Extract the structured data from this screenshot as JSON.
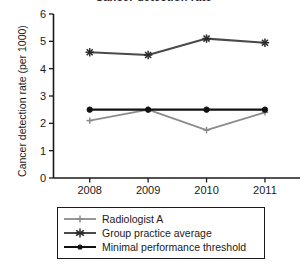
{
  "chart_data": {
    "type": "line",
    "title": "Cancer detection rate",
    "xlabel": "",
    "ylabel": "Cancer detection rate (per 1000)",
    "categories": [
      "2008",
      "2009",
      "2010",
      "2011"
    ],
    "x_tick_labels": [
      "2008",
      "2009",
      "2010",
      "2011"
    ],
    "y_tick_labels": [
      "0",
      "1",
      "2",
      "3",
      "4",
      "5",
      "6"
    ],
    "ylim": [
      0,
      6
    ],
    "y_tick_step": 1,
    "grid": false,
    "legend_position": "below-axes",
    "series": [
      {
        "name": "Radiologist A",
        "values": [
          2.1,
          2.5,
          1.75,
          2.4
        ],
        "color": "#8c8c8c",
        "marker": "cross"
      },
      {
        "name": "Group practice average",
        "values": [
          4.6,
          4.5,
          5.1,
          4.95
        ],
        "color": "#4a4a4a",
        "marker": "asterisk"
      },
      {
        "name": "Minimal performance threshold",
        "values": [
          2.5,
          2.5,
          2.5,
          2.5
        ],
        "color": "#111111",
        "marker": "circle"
      }
    ]
  },
  "axis": {
    "y_title": "Cancer detection rate (per 1000)",
    "y_ticks": [
      "6",
      "5",
      "4",
      "3",
      "2",
      "1",
      "0"
    ],
    "x_ticks": [
      "2008",
      "2009",
      "2010",
      "2011"
    ]
  },
  "legend": {
    "entries": [
      {
        "label": "Radiologist A"
      },
      {
        "label": "Group practice average"
      },
      {
        "label": "Minimal performance threshold"
      }
    ]
  },
  "colors": {
    "axis": "#1a1a1a",
    "radiologist": "#8c8c8c",
    "group_average": "#4a4a4a",
    "threshold": "#111111",
    "background": "#ffffff"
  }
}
